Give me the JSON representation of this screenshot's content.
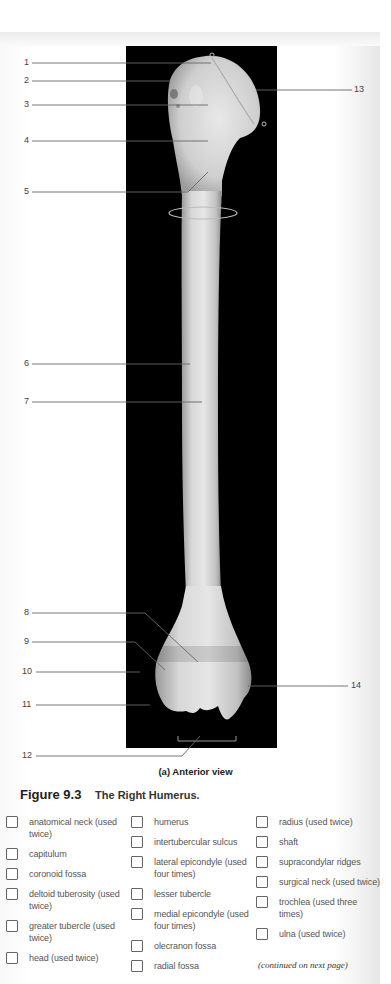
{
  "figure": {
    "number": "Figure 9.3",
    "title": "The Right Humerus.",
    "view_caption": "(a) Anterior view",
    "continued_note": "(continued on next page)"
  },
  "callouts": {
    "left": [
      "1",
      "2",
      "3",
      "4",
      "5",
      "6",
      "7",
      "8",
      "9",
      "10",
      "11",
      "12"
    ],
    "right": [
      "13",
      "14"
    ]
  },
  "terms": {
    "column1": [
      {
        "label": "anatomical neck (used twice)",
        "checked": false
      },
      {
        "label": "capitulum",
        "checked": false
      },
      {
        "label": "coronoid fossa",
        "checked": false
      },
      {
        "label": "deltoid tuberosity (used twice)",
        "checked": false
      },
      {
        "label": "greater tubercle (used twice)",
        "checked": false
      },
      {
        "label": "head (used twice)",
        "checked": false
      }
    ],
    "column2": [
      {
        "label": "humerus",
        "checked": false
      },
      {
        "label": "intertubercular sulcus",
        "checked": false
      },
      {
        "label": "lateral epicondyle (used four times)",
        "checked": false
      },
      {
        "label": "lesser tubercle",
        "checked": false
      },
      {
        "label": "medial epicondyle (used four times)",
        "checked": false
      },
      {
        "label": "olecranon fossa",
        "checked": false
      },
      {
        "label": "radial fossa",
        "checked": false
      }
    ],
    "column3": [
      {
        "label": "radius (used twice)",
        "checked": false
      },
      {
        "label": "shaft",
        "checked": false
      },
      {
        "label": "supracondylar ridges",
        "checked": false
      },
      {
        "label": "surgical neck (used twice)",
        "checked": false
      },
      {
        "label": "trochlea (used three times)",
        "checked": false
      },
      {
        "label": "ulna (used twice)",
        "checked": false
      }
    ]
  }
}
